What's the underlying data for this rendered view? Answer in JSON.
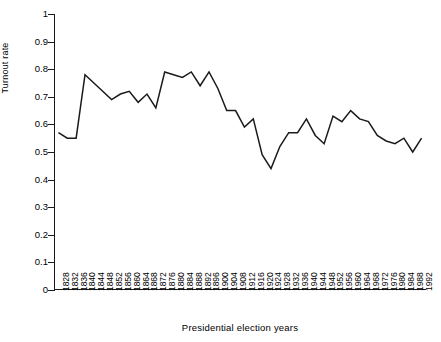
{
  "chart_data": {
    "type": "line",
    "title": "",
    "xlabel": "Presidential election years",
    "ylabel": "Turnout rate",
    "grid": false,
    "legend": false,
    "ylim": [
      0,
      1
    ],
    "ytick_labels": [
      "1",
      "0.9",
      "0.8",
      "0.7",
      "0.6",
      "0.5",
      "0.4",
      "0.3",
      "0.2",
      "0.1",
      "0"
    ],
    "ytick_values": [
      1,
      0.9,
      0.8,
      0.7,
      0.6,
      0.5,
      0.4,
      0.3,
      0.2,
      0.1,
      0
    ],
    "categories": [
      "1828",
      "1832",
      "1836",
      "1840",
      "1844",
      "1848",
      "1852",
      "1856",
      "1860",
      "1864",
      "1868",
      "1872",
      "1876",
      "1880",
      "1884",
      "1888",
      "1892",
      "1896",
      "1900",
      "1904",
      "1908",
      "1912",
      "1916",
      "1920",
      "1924",
      "1928",
      "1932",
      "1936",
      "1940",
      "1944",
      "1948",
      "1952",
      "1956",
      "1960",
      "1964",
      "1968",
      "1972",
      "1976",
      "1980",
      "1984",
      "1988",
      "1992"
    ],
    "series": [
      {
        "name": "Turnout rate",
        "values": [
          0.57,
          0.55,
          0.55,
          0.78,
          0.75,
          0.72,
          0.69,
          0.71,
          0.72,
          0.68,
          0.71,
          0.66,
          0.79,
          0.78,
          0.77,
          0.79,
          0.74,
          0.79,
          0.73,
          0.65,
          0.65,
          0.59,
          0.62,
          0.49,
          0.44,
          0.52,
          0.57,
          0.57,
          0.62,
          0.56,
          0.53,
          0.63,
          0.61,
          0.65,
          0.62,
          0.61,
          0.56,
          0.54,
          0.53,
          0.55,
          0.5,
          0.55
        ]
      }
    ]
  },
  "axes": {
    "y_title": "Turnout rate",
    "x_title": "Presidential election years"
  }
}
